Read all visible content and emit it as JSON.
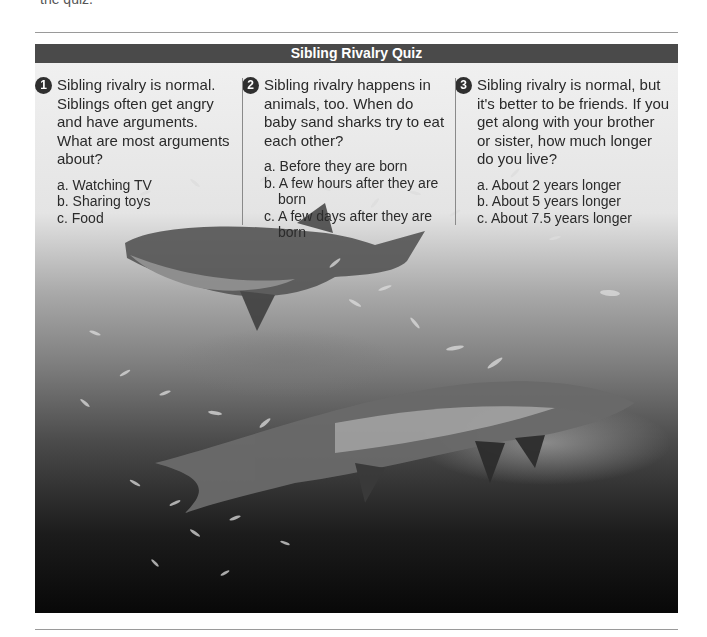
{
  "page": {
    "cut_off_text": "the quiz."
  },
  "quiz": {
    "title": "Sibling Rivalry Quiz",
    "colors": {
      "header_bg": "#4a4a4a",
      "header_text": "#ffffff",
      "panel_bg": "#f0f0f0",
      "badge_bg": "#2f2f2f"
    },
    "questions": [
      {
        "number": "1",
        "text": "Sibling rivalry is normal. Siblings often get angry and have arguments. What are most arguments about?",
        "answers": [
          "a. Watching TV",
          "b. Sharing toys",
          "c. Food"
        ]
      },
      {
        "number": "2",
        "text": "Sibling rivalry happens in animals, too. When do baby sand sharks try to eat each other?",
        "answers": [
          "a. Before they are born",
          "b. A few hours after they are born",
          "c. A few days after they are born"
        ]
      },
      {
        "number": "3",
        "text": "Sibling rivalry is normal, but it's better to be friends. If you get along with your brother or sister, how much longer do you live?",
        "answers": [
          "a. About 2 years longer",
          "b. About 5 years longer",
          "c. About 7.5 years longer"
        ]
      }
    ]
  },
  "photo": {
    "subject": "Two sand tiger sharks swimming among a school of small fish underwater"
  }
}
